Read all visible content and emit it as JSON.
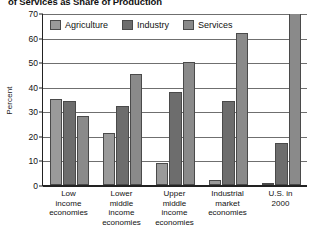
{
  "chart_data": {
    "type": "bar",
    "title": "of Services as Share of Production",
    "xlabel": "",
    "ylabel": "Percent",
    "ylim": [
      0,
      70
    ],
    "yticks": [
      0,
      10,
      20,
      30,
      40,
      50,
      60,
      70
    ],
    "ytick_labels": [
      "0",
      "10",
      "20",
      "30",
      "40",
      "50",
      "60",
      "70"
    ],
    "grid": true,
    "legend_position": "top-left-inside",
    "categories": [
      "Low income economies",
      "Lower middle income economies",
      "Upper middle income economies",
      "Industrial market economies",
      "U.S. in 2000"
    ],
    "category_lines": [
      [
        "Low",
        "income",
        "economies"
      ],
      [
        "Lower",
        "middle",
        "income",
        "economies"
      ],
      [
        "Upper",
        "middle",
        "income",
        "economies"
      ],
      [
        "Industrial",
        "market",
        "economies"
      ],
      [
        "U.S. in",
        "2000"
      ]
    ],
    "series": [
      {
        "name": "Agriculture",
        "color": "#9a9a9a",
        "values": [
          35,
          21,
          9,
          2,
          1
        ]
      },
      {
        "name": "Industry",
        "color": "#6d6d6d",
        "values": [
          34,
          32,
          38,
          34,
          17
        ]
      },
      {
        "name": "Services",
        "color": "#8a8a8a",
        "values": [
          28,
          45,
          50,
          62,
          72
        ]
      }
    ]
  },
  "legend": {
    "items": [
      {
        "label": "Agriculture"
      },
      {
        "label": "Industry"
      },
      {
        "label": "Services"
      }
    ]
  }
}
